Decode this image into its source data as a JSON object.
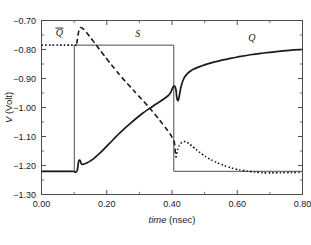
{
  "figure": {
    "background_color": "#ffffff",
    "frame_color": "#4d4d4d"
  },
  "chart_data": {
    "type": "line",
    "title": "",
    "subtitle": "",
    "xlabel_italic": "time",
    "xlabel_rest": " (nsec)",
    "ylabel_italic": "V",
    "ylabel_rest": " (Volt)",
    "xlim": [
      0.0,
      0.8
    ],
    "ylim": [
      -1.3,
      -0.7
    ],
    "xticks": [
      0.0,
      0.2,
      0.4,
      0.6,
      0.8
    ],
    "xticklabels": [
      "0.00",
      "0.20",
      "0.40",
      "0.60",
      "0.80"
    ],
    "yticks": [
      -0.7,
      -0.8,
      -0.9,
      -1.0,
      -1.1,
      -1.2,
      -1.3
    ],
    "yticklabels": [
      "−0.70",
      "−0.80",
      "−0.90",
      "−1.00",
      "−1.10",
      "−1.20",
      "−1.30"
    ],
    "x_minor_ticks": [
      0.1,
      0.3,
      0.5,
      0.7
    ],
    "y_minor_ticks": [
      -0.75,
      -0.85,
      -0.95,
      -1.05,
      -1.15,
      -1.25
    ],
    "grid": false,
    "legend_position": "inline-annotations",
    "annotations": [
      {
        "name": "Qbar",
        "text": "Q",
        "overbar": true,
        "x": 0.055,
        "y": -0.755
      },
      {
        "name": "S",
        "text": "S",
        "overbar": false,
        "x": 0.295,
        "y": -0.757
      },
      {
        "name": "Q",
        "text": "Q",
        "overbar": false,
        "x": 0.645,
        "y": -0.77
      }
    ],
    "series": [
      {
        "name": "S",
        "label": "S",
        "style": "solid-thin",
        "color": "#4d4d4d",
        "linewidth": 1.0,
        "description": "Input set pulse: low at -1.22 V, steps high to -0.785 V at t=0.10 nsec, returns low at t=0.405 nsec",
        "x": [
          0.0,
          0.1,
          0.1005,
          0.1005,
          0.405,
          0.4055,
          0.4055,
          0.8
        ],
        "y": [
          -1.22,
          -1.22,
          -1.22,
          -0.785,
          -0.785,
          -0.785,
          -1.22,
          -1.22
        ]
      },
      {
        "name": "Q",
        "label": "Q",
        "style": "solid-thick",
        "color": "#1a1a1a",
        "linewidth": 1.7,
        "description": "Output Q: rises from -1.22 V after set pulse, small glitch at 0.12, smooth climb to -0.925, dip to -0.975 at 0.415, then sharp rise asymptoting to -0.80 V",
        "x": [
          0.0,
          0.03,
          0.06,
          0.09,
          0.1,
          0.105,
          0.11,
          0.1135,
          0.118,
          0.1215,
          0.125,
          0.13,
          0.14,
          0.15,
          0.16,
          0.175,
          0.19,
          0.21,
          0.23,
          0.25,
          0.27,
          0.29,
          0.31,
          0.33,
          0.35,
          0.37,
          0.385,
          0.395,
          0.403,
          0.408,
          0.412,
          0.4145,
          0.417,
          0.42,
          0.424,
          0.428,
          0.434,
          0.44,
          0.448,
          0.458,
          0.47,
          0.485,
          0.5,
          0.52,
          0.545,
          0.57,
          0.6,
          0.64,
          0.68,
          0.72,
          0.76,
          0.8
        ],
        "y": [
          -1.22,
          -1.22,
          -1.22,
          -1.22,
          -1.221,
          -1.2225,
          -1.215,
          -1.188,
          -1.182,
          -1.193,
          -1.196,
          -1.195,
          -1.1905,
          -1.184,
          -1.176,
          -1.161,
          -1.145,
          -1.122,
          -1.099,
          -1.077,
          -1.057,
          -1.038,
          -1.02,
          -1.004,
          -0.989,
          -0.974,
          -0.962,
          -0.95,
          -0.93,
          -0.9265,
          -0.938,
          -0.964,
          -0.975,
          -0.972,
          -0.95,
          -0.927,
          -0.906,
          -0.893,
          -0.882,
          -0.873,
          -0.866,
          -0.859,
          -0.853,
          -0.846,
          -0.839,
          -0.833,
          -0.826,
          -0.818,
          -0.812,
          -0.807,
          -0.803,
          -0.8
        ]
      },
      {
        "name": "Qbar-early",
        "label": "Q̄",
        "style": "dotted",
        "color": "#1a1a1a",
        "linewidth": 1.6,
        "description": "Complement Q-bar, initial high plateau at -0.785 V before the set pulse",
        "x": [
          0.0,
          0.02,
          0.04,
          0.06,
          0.08,
          0.095,
          0.103,
          0.108
        ],
        "y": [
          -0.785,
          -0.785,
          -0.785,
          -0.785,
          -0.785,
          -0.785,
          -0.785,
          -0.784
        ]
      },
      {
        "name": "Qbar-fall",
        "label": "Q̄",
        "style": "dashed",
        "color": "#1a1a1a",
        "linewidth": 1.6,
        "description": "Complement Q-bar falling transition: overshoot peak -0.723 V at 0.118 then monotone decay crossing Q near 0.35 and plunging at 0.41",
        "x": [
          0.108,
          0.112,
          0.116,
          0.12,
          0.126,
          0.134,
          0.144,
          0.156,
          0.17,
          0.186,
          0.204,
          0.224,
          0.246,
          0.27,
          0.296,
          0.322,
          0.348,
          0.372,
          0.392,
          0.402,
          0.407,
          0.409,
          0.4105,
          0.412
        ],
        "y": [
          -0.78,
          -0.75,
          -0.73,
          -0.724,
          -0.727,
          -0.736,
          -0.75,
          -0.767,
          -0.788,
          -0.812,
          -0.838,
          -0.866,
          -0.896,
          -0.926,
          -0.958,
          -0.99,
          -1.024,
          -1.058,
          -1.088,
          -1.106,
          -1.12,
          -1.14,
          -1.16,
          -1.172
        ]
      },
      {
        "name": "Qbar-recover",
        "label": "Q̄",
        "style": "dotted",
        "color": "#1a1a1a",
        "linewidth": 1.6,
        "description": "Complement Q-bar after reset: small hump peaking at -1.118 V near 0.44 then decay back to the -1.225 V rail",
        "x": [
          0.412,
          0.415,
          0.419,
          0.424,
          0.43,
          0.436,
          0.442,
          0.45,
          0.458,
          0.468,
          0.48,
          0.494,
          0.51,
          0.528,
          0.548,
          0.57,
          0.594,
          0.618,
          0.642,
          0.666,
          0.692,
          0.72,
          0.75,
          0.78,
          0.8
        ],
        "y": [
          -1.172,
          -1.156,
          -1.14,
          -1.128,
          -1.121,
          -1.118,
          -1.118,
          -1.123,
          -1.13,
          -1.139,
          -1.15,
          -1.162,
          -1.174,
          -1.185,
          -1.195,
          -1.204,
          -1.212,
          -1.217,
          -1.221,
          -1.224,
          -1.2255,
          -1.225,
          -1.2245,
          -1.224,
          -1.224
        ]
      }
    ]
  }
}
